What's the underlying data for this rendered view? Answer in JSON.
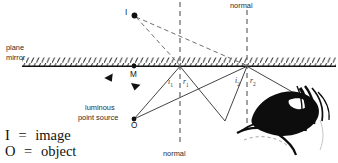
{
  "diagram": {
    "title_alt": "Plane mirror reflection with two reflection points, image I and object O",
    "labels": {
      "plane": "plane",
      "mirror": "mirror",
      "normal_top": "normal",
      "normal_bottom": "normal",
      "image_point": "I",
      "mirror_point": "M",
      "object_point": "O",
      "source_line1": "luminous",
      "source_line2": "point source",
      "angle_i1": "i",
      "angle_i1_sub": "1",
      "angle_r1": "r",
      "angle_r1_sub": "1",
      "angle_i2": "i",
      "angle_i2_sub": "2",
      "angle_r2": "r",
      "angle_r2_sub": "2"
    },
    "legend": [
      {
        "symbol": "I",
        "equals": "=",
        "meaning": "image"
      },
      {
        "symbol": "O",
        "equals": "=",
        "meaning": "object"
      }
    ],
    "colors": {
      "ink": "#111111",
      "ray": "#3a3a3a",
      "dashed": "#6e6e6e",
      "hatch": "#333333",
      "background": "#ffffff"
    },
    "geometry": {
      "mirror_y": 66,
      "mirror_x_start": 22,
      "mirror_x_end": 336,
      "point_I": [
        134,
        15
      ],
      "point_M": [
        134,
        66
      ],
      "point_O": [
        134,
        119
      ],
      "reflect_1": [
        180,
        66
      ],
      "reflect_2": [
        247,
        66
      ],
      "vertex_bottom": [
        225,
        121
      ],
      "eye_target": [
        300,
        97
      ],
      "normal_1_x": 180,
      "normal_2_x": 247
    }
  }
}
